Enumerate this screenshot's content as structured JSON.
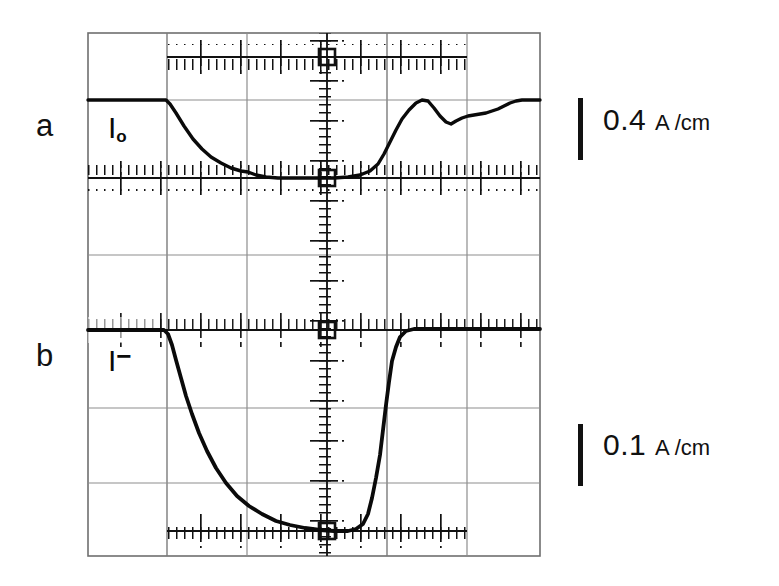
{
  "figure": {
    "kind": "oscilloscope-screenshot",
    "background_color": "#ffffff",
    "ink_color": "#111111",
    "graticule_color": "#8a8a8a",
    "frame": {
      "x0": 88,
      "y0": 33,
      "x1": 540,
      "y1": 556
    },
    "panels": [
      {
        "id": "a",
        "letter": "a",
        "trace_label_symbol": "I",
        "trace_label_subscript": "o",
        "scale_value": "0.4",
        "scale_unit": "A /cm"
      },
      {
        "id": "b",
        "letter": "b",
        "trace_label_symbol": "I",
        "trace_label_superscript": "−",
        "scale_value": "0.1",
        "scale_unit": "A /cm"
      }
    ]
  },
  "labels": {
    "panel_a_letter": "a",
    "panel_b_letter": "b",
    "trace_a_symbol": "I",
    "trace_a_subscript": "o",
    "trace_b_symbol": "I",
    "trace_b_superscript": "−",
    "scale_a_value": "0.4",
    "scale_a_unit": "A /cm",
    "scale_b_value": "0.1",
    "scale_b_unit": "A /cm"
  },
  "chart_data": {
    "type": "line",
    "title": "",
    "xlabel": "",
    "ylabel": "",
    "grid": true,
    "legend": "none",
    "note": "Two stacked oscilloscope traces on a 6x7 graticule; x axis is time (divisions), y axis is current in divisions of the stated A/cm scale.",
    "graticule": {
      "vertical_lines_px": [
        88,
        167,
        247,
        327,
        387,
        467,
        540
      ],
      "horizontal_lines_px": [
        33,
        100,
        178,
        255,
        330,
        408,
        483,
        556
      ],
      "minor_tick_axes_px": {
        "horizontal_axis_rows": [
          57,
          178,
          330,
          412,
          531
        ],
        "vertical_axis_column": 327
      }
    },
    "series": [
      {
        "name": "I_o (panel a)",
        "panel": "a",
        "scale": "0.4 A/cm",
        "baseline_div_y_px": 178,
        "top_level_y_px": 100,
        "points_px": [
          [
            88,
            100
          ],
          [
            120,
            100
          ],
          [
            150,
            100
          ],
          [
            166,
            100
          ],
          [
            170,
            104
          ],
          [
            176,
            113
          ],
          [
            184,
            126
          ],
          [
            193,
            139
          ],
          [
            202,
            149
          ],
          [
            211,
            157
          ],
          [
            221,
            163
          ],
          [
            231,
            168
          ],
          [
            241,
            171
          ],
          [
            248,
            172
          ],
          [
            256,
            175
          ],
          [
            266,
            177
          ],
          [
            278,
            178
          ],
          [
            292,
            178
          ],
          [
            306,
            178
          ],
          [
            320,
            178
          ],
          [
            334,
            178
          ],
          [
            348,
            177
          ],
          [
            360,
            175
          ],
          [
            370,
            171
          ],
          [
            378,
            164
          ],
          [
            384,
            154
          ],
          [
            390,
            142
          ],
          [
            396,
            130
          ],
          [
            402,
            119
          ],
          [
            409,
            110
          ],
          [
            416,
            103
          ],
          [
            422,
            100
          ],
          [
            428,
            101
          ],
          [
            434,
            108
          ],
          [
            440,
            116
          ],
          [
            446,
            122
          ],
          [
            451,
            124
          ],
          [
            456,
            121
          ],
          [
            462,
            118
          ],
          [
            468,
            116
          ],
          [
            474,
            115
          ],
          [
            480,
            114
          ],
          [
            486,
            113
          ],
          [
            492,
            111
          ],
          [
            498,
            109
          ],
          [
            504,
            106
          ],
          [
            510,
            103
          ],
          [
            516,
            101
          ],
          [
            522,
            100
          ],
          [
            530,
            100
          ],
          [
            540,
            100
          ]
        ]
      },
      {
        "name": "I^- (panel b)",
        "panel": "b",
        "scale": "0.1 A/cm",
        "baseline_div_y_px": 330,
        "bottom_level_y_px": 531,
        "points_px": [
          [
            88,
            330
          ],
          [
            120,
            330
          ],
          [
            150,
            330
          ],
          [
            164,
            330
          ],
          [
            168,
            334
          ],
          [
            172,
            345
          ],
          [
            176,
            360
          ],
          [
            181,
            378
          ],
          [
            186,
            396
          ],
          [
            192,
            414
          ],
          [
            199,
            433
          ],
          [
            207,
            451
          ],
          [
            216,
            468
          ],
          [
            226,
            483
          ],
          [
            237,
            496
          ],
          [
            249,
            506
          ],
          [
            262,
            514
          ],
          [
            276,
            521
          ],
          [
            290,
            525
          ],
          [
            305,
            528
          ],
          [
            320,
            530
          ],
          [
            334,
            531
          ],
          [
            348,
            531
          ],
          [
            356,
            529
          ],
          [
            363,
            524
          ],
          [
            368,
            514
          ],
          [
            372,
            498
          ],
          [
            376,
            478
          ],
          [
            380,
            455
          ],
          [
            383,
            430
          ],
          [
            386,
            405
          ],
          [
            389,
            382
          ],
          [
            392,
            361
          ],
          [
            396,
            347
          ],
          [
            400,
            337
          ],
          [
            406,
            331
          ],
          [
            414,
            329
          ],
          [
            424,
            329
          ],
          [
            440,
            329
          ],
          [
            460,
            329
          ],
          [
            490,
            329
          ],
          [
            520,
            329
          ],
          [
            540,
            329
          ]
        ]
      }
    ]
  }
}
